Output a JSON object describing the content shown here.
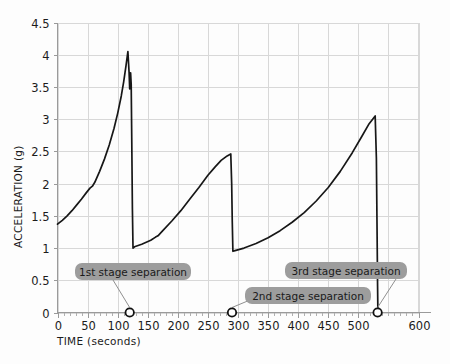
{
  "chart_data": {
    "type": "line",
    "title": "",
    "xlabel": "TIME (seconds)",
    "ylabel": "ACCELERATION (g)",
    "xlim": [
      0,
      600
    ],
    "ylim": [
      0,
      4.5
    ],
    "grid": true,
    "legend": "none",
    "x_ticks": [
      0,
      50,
      100,
      150,
      200,
      250,
      300,
      350,
      400,
      450,
      500,
      600
    ],
    "x_tick_labels": [
      "0",
      "50",
      "100",
      "150",
      "200",
      "250",
      "300",
      "350",
      "400",
      "450",
      "500",
      "600"
    ],
    "y_ticks": [
      0,
      0.5,
      1,
      1.5,
      2,
      2.5,
      3,
      3.5,
      4,
      4.5
    ],
    "y_tick_labels": [
      "0",
      "0.5",
      "1",
      "1.5",
      "2",
      "2.5",
      "3",
      "3.5",
      "4",
      "4.5"
    ],
    "series": [
      {
        "name": "acceleration",
        "points": [
          [
            0,
            1.37
          ],
          [
            8,
            1.43
          ],
          [
            16,
            1.5
          ],
          [
            24,
            1.58
          ],
          [
            32,
            1.67
          ],
          [
            40,
            1.76
          ],
          [
            48,
            1.86
          ],
          [
            54,
            1.93
          ],
          [
            58,
            1.96
          ],
          [
            62,
            2.02
          ],
          [
            70,
            2.19
          ],
          [
            78,
            2.38
          ],
          [
            86,
            2.6
          ],
          [
            94,
            2.86
          ],
          [
            100,
            3.09
          ],
          [
            106,
            3.36
          ],
          [
            110,
            3.58
          ],
          [
            114,
            3.84
          ],
          [
            117,
            4.05
          ],
          [
            119,
            3.72
          ],
          [
            120,
            3.47
          ],
          [
            121.5,
            3.72
          ],
          [
            122.5,
            3.54
          ],
          [
            123.5,
            2.6
          ],
          [
            124.5,
            1.6
          ],
          [
            125.5,
            1.0
          ],
          [
            128,
            1.02
          ],
          [
            140,
            1.06
          ],
          [
            155,
            1.12
          ],
          [
            163,
            1.17
          ],
          [
            167,
            1.19
          ],
          [
            175,
            1.27
          ],
          [
            190,
            1.42
          ],
          [
            205,
            1.58
          ],
          [
            220,
            1.76
          ],
          [
            235,
            1.94
          ],
          [
            250,
            2.13
          ],
          [
            262,
            2.26
          ],
          [
            272,
            2.36
          ],
          [
            282,
            2.43
          ],
          [
            288,
            2.46
          ],
          [
            289.5,
            2.0
          ],
          [
            290.5,
            1.4
          ],
          [
            291.5,
            0.95
          ],
          [
            295,
            0.96
          ],
          [
            310,
            1.0
          ],
          [
            330,
            1.07
          ],
          [
            350,
            1.16
          ],
          [
            370,
            1.27
          ],
          [
            390,
            1.4
          ],
          [
            410,
            1.55
          ],
          [
            430,
            1.73
          ],
          [
            450,
            1.94
          ],
          [
            470,
            2.19
          ],
          [
            490,
            2.48
          ],
          [
            505,
            2.72
          ],
          [
            518,
            2.93
          ],
          [
            528,
            3.05
          ],
          [
            530,
            2.4
          ],
          [
            531,
            1.4
          ],
          [
            532,
            0.4
          ],
          [
            532.5,
            0.0
          ]
        ]
      }
    ],
    "annotations": [
      {
        "id": "stage1",
        "label": "1st stage separation",
        "marker_x": 120,
        "marker_y": 0
      },
      {
        "id": "stage2",
        "label": "2nd stage separation",
        "marker_x": 290,
        "marker_y": 0
      },
      {
        "id": "stage3",
        "label": "3rd stage separation",
        "marker_x": 532,
        "marker_y": 0
      }
    ],
    "colors": {
      "line": "#171717",
      "grid": "#d8d8d8",
      "axis": "#9a9a9a",
      "annotation_background": "#9d9d9d",
      "annotation_text": "#1a1a1a",
      "background": "#fdfdfd"
    }
  }
}
